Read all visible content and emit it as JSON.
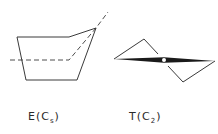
{
  "figures": [
    {
      "id": "envelope",
      "label": "E(C",
      "subscript": "s",
      "label_close": ")",
      "description": "Envelope conformation with Cs symmetry plane (dashed)"
    },
    {
      "id": "twist",
      "label": "T(C",
      "subscript": "2",
      "label_close": ")",
      "description": "Twist conformation with C2 axis (point marked)"
    }
  ],
  "colors": {
    "line": "#3a3a3a",
    "background": "#ffffff"
  }
}
